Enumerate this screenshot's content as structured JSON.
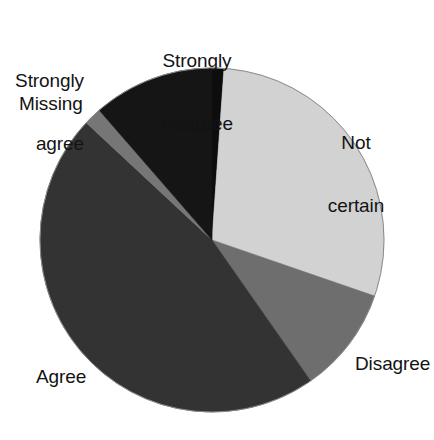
{
  "chart_data": {
    "type": "pie",
    "title": "",
    "subtitle": "",
    "xlabel": "",
    "ylabel": "",
    "grid": false,
    "legend_position": "none",
    "label_placement": "outside",
    "start_angle_deg": 0,
    "direction": "clockwise",
    "categories": [
      "Strongly disagree",
      "Not certain",
      "Disagree",
      "Agree",
      "Missing",
      "Strongly agree"
    ],
    "values": [
      1.1,
      29.2,
      10.0,
      46.7,
      1.7,
      11.3
    ],
    "units": "percent",
    "slices": [
      {
        "label": "Strongly disagree",
        "value": 1.1,
        "start_deg": 0,
        "end_deg": 4,
        "color": "#0d0d0d"
      },
      {
        "label": "Not certain",
        "value": 29.2,
        "start_deg": 4,
        "end_deg": 109,
        "color": "#d2d2d2"
      },
      {
        "label": "Disagree",
        "value": 10.0,
        "start_deg": 109,
        "end_deg": 145,
        "color": "#6e6e6e"
      },
      {
        "label": "Agree",
        "value": 46.7,
        "start_deg": 145,
        "end_deg": 313,
        "color": "#333333"
      },
      {
        "label": "Missing",
        "value": 1.7,
        "start_deg": 313,
        "end_deg": 319,
        "color": "#767676"
      },
      {
        "label": "Strongly agree",
        "value": 11.3,
        "start_deg": 319,
        "end_deg": 360,
        "color": "#151515"
      }
    ]
  },
  "labels": {
    "strongly_disagree_line1": "Strongly",
    "strongly_disagree_line2": "disagree",
    "strongly_agree_line1": "Strongly",
    "strongly_agree_line2": "agree",
    "missing": "Missing",
    "not_certain_line1": "Not",
    "not_certain_line2": "certain",
    "disagree": "Disagree",
    "agree": "Agree"
  },
  "geometry": {
    "center_x": 212,
    "center_y": 240,
    "radius": 172
  },
  "colors": {
    "background": "#ffffff",
    "text": "#131313",
    "outline": "#8a8a8a"
  }
}
